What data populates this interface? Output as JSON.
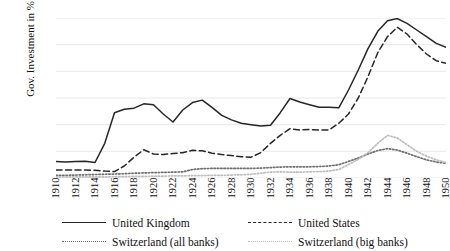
{
  "chart_data": {
    "type": "line",
    "title": "",
    "xlabel": "",
    "ylabel": "Gov. Investment in % Total Assets",
    "xlim": [
      1910,
      1950
    ],
    "ylim": [
      0,
      60
    ],
    "grid": true,
    "legend_position": "bottom",
    "ytick_labels": [
      "0%",
      "10%",
      "20%",
      "30%",
      "40%",
      "50%",
      "60%"
    ],
    "ytick_values": [
      0,
      10,
      20,
      30,
      40,
      50,
      60
    ],
    "xtick_labels": [
      "1910",
      "1912",
      "1914",
      "1916",
      "1918",
      "1920",
      "1922",
      "1924",
      "1926",
      "1928",
      "1930",
      "1932",
      "1934",
      "1936",
      "1938",
      "1940",
      "1942",
      "1944",
      "1946",
      "1948",
      "1950"
    ],
    "xtick_values": [
      1910,
      1912,
      1914,
      1916,
      1918,
      1920,
      1922,
      1924,
      1926,
      1928,
      1930,
      1932,
      1934,
      1936,
      1938,
      1940,
      1942,
      1944,
      1946,
      1948,
      1950
    ],
    "x": [
      1910,
      1911,
      1912,
      1913,
      1914,
      1915,
      1916,
      1917,
      1918,
      1919,
      1920,
      1921,
      1922,
      1923,
      1924,
      1925,
      1926,
      1927,
      1928,
      1929,
      1930,
      1931,
      1932,
      1933,
      1934,
      1935,
      1936,
      1937,
      1938,
      1939,
      1940,
      1941,
      1942,
      1943,
      1944,
      1945,
      1946,
      1947,
      1948,
      1949,
      1950
    ],
    "series": [
      {
        "name": "United Kingdom",
        "style": "solid",
        "color": "#262626",
        "values": [
          6.2,
          6.0,
          6.2,
          6.3,
          5.8,
          13.0,
          24.5,
          25.8,
          26.2,
          27.8,
          27.5,
          24.0,
          21.0,
          25.5,
          28.3,
          29.2,
          26.5,
          23.5,
          21.8,
          20.5,
          20.0,
          19.5,
          19.8,
          24.5,
          29.8,
          28.5,
          27.5,
          26.5,
          26.5,
          26.3,
          33.0,
          40.5,
          48.5,
          55.0,
          59.0,
          59.8,
          58.0,
          55.5,
          53.0,
          50.5,
          49.0
        ]
      },
      {
        "name": "United States",
        "style": "dashed",
        "color": "#262626",
        "values": [
          3.0,
          3.0,
          3.0,
          3.0,
          2.9,
          2.6,
          2.4,
          4.5,
          7.8,
          10.6,
          9.0,
          8.8,
          9.2,
          9.5,
          10.4,
          10.2,
          9.3,
          8.8,
          8.4,
          8.0,
          7.8,
          9.5,
          13.0,
          16.0,
          18.5,
          18.0,
          18.2,
          18.0,
          18.0,
          20.5,
          24.0,
          30.0,
          38.0,
          47.0,
          53.0,
          56.5,
          54.0,
          50.0,
          46.5,
          44.0,
          43.0
        ]
      },
      {
        "name": "Switzerland (all banks)",
        "style": "dotted",
        "color": "#6f6f6f",
        "values": [
          1.0,
          1.0,
          1.1,
          1.2,
          1.3,
          1.4,
          1.5,
          1.6,
          1.8,
          1.9,
          2.0,
          2.1,
          2.2,
          2.3,
          3.2,
          3.5,
          3.6,
          3.6,
          3.6,
          3.6,
          3.6,
          3.7,
          3.9,
          4.1,
          4.2,
          4.2,
          4.2,
          4.3,
          4.5,
          5.0,
          6.2,
          7.5,
          9.0,
          10.3,
          11.0,
          10.5,
          9.3,
          8.0,
          6.8,
          6.0,
          5.5
        ]
      },
      {
        "name": "Switzerland (big banks)",
        "style": "dotted",
        "color": "#bdbdbd",
        "values": [
          0.4,
          0.4,
          0.4,
          0.4,
          0.4,
          0.4,
          0.5,
          0.5,
          0.6,
          0.6,
          0.7,
          0.7,
          0.8,
          0.8,
          0.9,
          0.9,
          1.0,
          1.0,
          1.1,
          1.2,
          1.4,
          1.8,
          2.2,
          2.3,
          2.2,
          2.2,
          2.3,
          2.4,
          2.6,
          3.2,
          5.0,
          7.0,
          9.5,
          13.0,
          16.0,
          15.0,
          12.5,
          10.0,
          8.2,
          6.8,
          5.8
        ]
      }
    ]
  },
  "legend": {
    "items": [
      {
        "label": "United Kingdom",
        "icon": "solid-line-icon"
      },
      {
        "label": "United States",
        "icon": "dashed-line-icon"
      },
      {
        "label": "Switzerland (all banks)",
        "icon": "dotted-line-icon"
      },
      {
        "label": "Switzerland (big banks)",
        "icon": "dotted-line-light-icon"
      }
    ]
  }
}
